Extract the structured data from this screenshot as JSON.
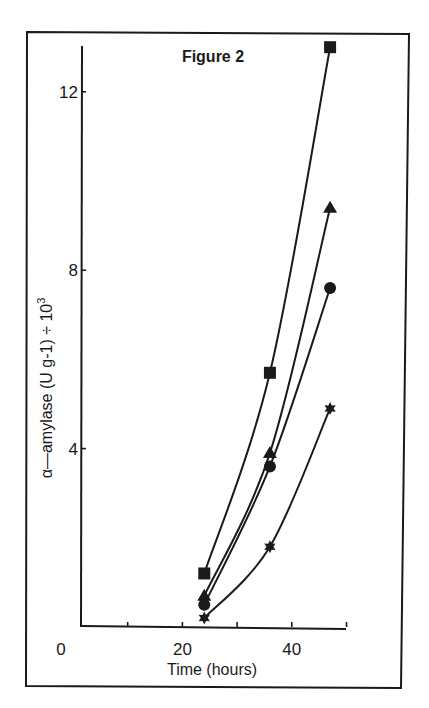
{
  "chart_data": {
    "type": "line",
    "title": "Figure 2",
    "xlabel": "Time (hours)",
    "ylabel": "α—amylase (U g-1) ÷ 10",
    "ylabel_superscript": "3",
    "xlim": [
      0,
      50
    ],
    "ylim": [
      0,
      13.5
    ],
    "x_ticks": [
      0,
      10,
      20,
      30,
      40,
      50
    ],
    "x_tick_labels": [
      "0",
      "",
      "20",
      "",
      "40",
      ""
    ],
    "y_ticks": [
      0,
      4,
      8,
      12
    ],
    "y_tick_labels": [
      "",
      "4",
      "8",
      "12"
    ],
    "grid": false,
    "legend": null,
    "x": [
      24,
      36,
      47
    ],
    "series": [
      {
        "name": "square",
        "marker": "square",
        "values": [
          1.2,
          5.7,
          13.0
        ]
      },
      {
        "name": "triangle",
        "marker": "triangle",
        "values": [
          0.7,
          3.9,
          9.4
        ]
      },
      {
        "name": "circle",
        "marker": "circle",
        "values": [
          0.5,
          3.6,
          7.6
        ]
      },
      {
        "name": "star",
        "marker": "star",
        "values": [
          0.2,
          1.8,
          4.9
        ]
      }
    ]
  },
  "colors": {
    "ink": "#1a1a1a",
    "background": "#ffffff"
  }
}
